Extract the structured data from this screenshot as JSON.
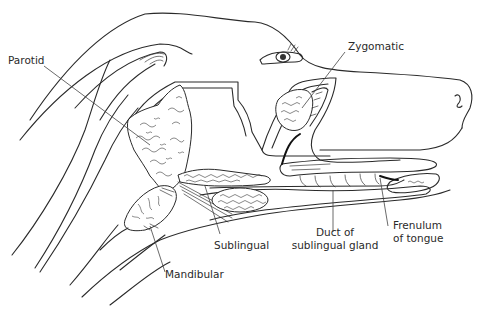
{
  "diagram": {
    "colors": {
      "ink": "#2a2a2a",
      "background": "#ffffff"
    },
    "labels": {
      "parotid": "Parotid",
      "zygomatic": "Zygomatic",
      "sublingual": "Sublingual",
      "mandibular": "Mandibular",
      "duct_line1": "Duct of",
      "duct_line2": "sublingual gland",
      "frenulum_line1": "Frenulum",
      "frenulum_line2": "of tongue"
    }
  }
}
